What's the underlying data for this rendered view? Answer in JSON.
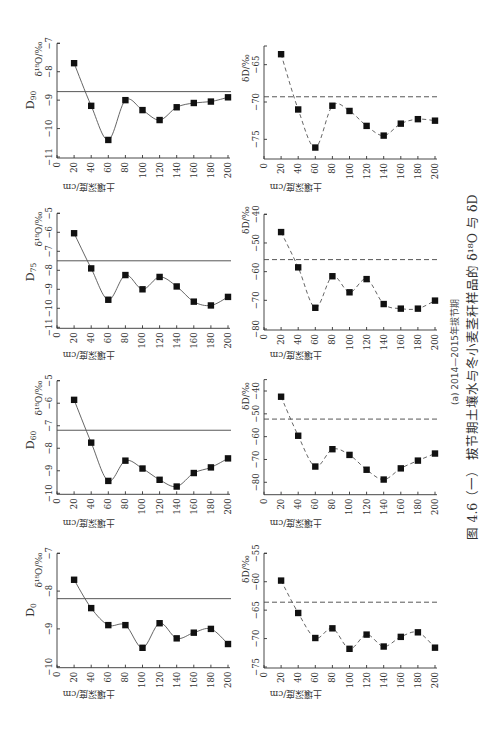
{
  "figure": {
    "caption": "图 4.6（一）  拔节期土壤水与冬小麦茎秆样品的 δ¹⁸O 与 δD",
    "subcaption": "(a) 2014—2015年拔节期",
    "layout_note": "page rotated 90° counter-clockwise; soil depth axis runs horizontally"
  },
  "chart_data": [
    {
      "type": "line",
      "panel": "D90",
      "label_main": "D",
      "label_sub": "90",
      "variable": "δ18O",
      "xlabel": "土壤深度/cm",
      "ylabel": "δ¹⁸O/‰",
      "x": [
        20,
        40,
        60,
        80,
        100,
        120,
        140,
        160,
        180,
        200
      ],
      "values": [
        -7.7,
        -9.2,
        -10.4,
        -9.0,
        -9.35,
        -9.7,
        -9.25,
        -9.1,
        -9.05,
        -8.9
      ],
      "xlim": [
        0,
        200
      ],
      "ylim": [
        -11,
        -7
      ],
      "xticks": [
        0,
        20,
        40,
        60,
        80,
        100,
        120,
        140,
        160,
        180,
        200
      ],
      "xticklabels": [
        "0",
        "20",
        "40",
        "60",
        "80",
        "100",
        "120",
        "140",
        "160",
        "180",
        "200"
      ],
      "yticks": [
        -11,
        -10,
        -9,
        -8,
        -7
      ],
      "yticklabels": [
        "−11",
        "−10",
        "−9",
        "−8",
        "−7"
      ],
      "reference_line": -8.7,
      "reference_style": "solid",
      "line_style": "solid",
      "marker": "square",
      "grid": false
    },
    {
      "type": "line",
      "panel": "D90",
      "label_main": "D",
      "label_sub": "90",
      "variable": "δD",
      "xlabel": "土壤深度/cm",
      "ylabel": "δD/‰",
      "x": [
        20,
        40,
        60,
        80,
        100,
        120,
        140,
        160,
        180,
        200
      ],
      "values": [
        -63.6,
        -71.0,
        -76.1,
        -70.5,
        -71.2,
        -73.2,
        -74.5,
        -72.9,
        -72.3,
        -72.5
      ],
      "xlim": [
        0,
        200
      ],
      "ylim": [
        -77.5,
        -62.5
      ],
      "xticks": [
        0,
        20,
        40,
        60,
        80,
        100,
        120,
        140,
        160,
        180,
        200
      ],
      "xticklabels": [
        "0",
        "20",
        "40",
        "60",
        "80",
        "100",
        "120",
        "140",
        "160",
        "180",
        "200"
      ],
      "yticks": [
        -75,
        -70,
        -65
      ],
      "yticklabels": [
        "−75",
        "−70",
        "−65"
      ],
      "reference_line": -69.3,
      "reference_style": "dashed",
      "line_style": "dashed",
      "marker": "square",
      "grid": false
    },
    {
      "type": "line",
      "panel": "D75",
      "label_main": "D",
      "label_sub": "75",
      "variable": "δ18O",
      "xlabel": "土壤深度/cm",
      "ylabel": "δ¹⁸O/‰",
      "x": [
        20,
        40,
        60,
        80,
        100,
        120,
        140,
        160,
        180,
        200
      ],
      "values": [
        -6.05,
        -7.9,
        -9.55,
        -8.25,
        -9.0,
        -8.35,
        -8.85,
        -9.65,
        -9.85,
        -9.4
      ],
      "xlim": [
        0,
        200
      ],
      "ylim": [
        -11,
        -5
      ],
      "xticks": [
        0,
        20,
        40,
        60,
        80,
        100,
        120,
        140,
        160,
        180,
        200
      ],
      "xticklabels": [
        "0",
        "20",
        "40",
        "60",
        "80",
        "100",
        "120",
        "140",
        "160",
        "180",
        "200"
      ],
      "yticks": [
        -11,
        -10,
        -9,
        -8,
        -7,
        -6,
        -5
      ],
      "yticklabels": [
        "−11",
        "−10",
        "−9",
        "−8",
        "−7",
        "−6",
        "−5"
      ],
      "reference_line": -7.5,
      "reference_style": "solid",
      "line_style": "solid",
      "marker": "square",
      "grid": false
    },
    {
      "type": "line",
      "panel": "D75",
      "label_main": "D",
      "label_sub": "75",
      "variable": "δD",
      "xlabel": "土壤深度/cm",
      "ylabel": "δD/‰",
      "x": [
        20,
        40,
        60,
        80,
        100,
        120,
        140,
        160,
        180,
        200
      ],
      "values": [
        -46.2,
        -58.5,
        -72.6,
        -61.6,
        -67.2,
        -62.6,
        -71.3,
        -72.9,
        -72.9,
        -70.1
      ],
      "xlim": [
        0,
        200
      ],
      "ylim": [
        -80,
        -40
      ],
      "xticks": [
        0,
        20,
        40,
        60,
        80,
        100,
        120,
        140,
        160,
        180,
        200
      ],
      "xticklabels": [
        "0",
        "20",
        "40",
        "60",
        "80",
        "100",
        "120",
        "140",
        "160",
        "180",
        "200"
      ],
      "yticks": [
        -80,
        -70,
        -60,
        -50,
        -40
      ],
      "yticklabels": [
        "−80",
        "−70",
        "−60",
        "−50",
        "−40"
      ],
      "reference_line": -55.8,
      "reference_style": "dashed",
      "line_style": "dashed",
      "marker": "square",
      "grid": false
    },
    {
      "type": "line",
      "panel": "D60",
      "label_main": "D",
      "label_sub": "60",
      "variable": "δ18O",
      "xlabel": "土壤深度/cm",
      "ylabel": "δ¹⁸O/‰",
      "x": [
        20,
        40,
        60,
        80,
        100,
        120,
        140,
        160,
        180,
        200
      ],
      "values": [
        -5.85,
        -7.75,
        -9.45,
        -8.55,
        -8.9,
        -9.4,
        -9.7,
        -9.1,
        -8.85,
        -8.45
      ],
      "xlim": [
        0,
        200
      ],
      "ylim": [
        -10,
        -5
      ],
      "xticks": [
        0,
        20,
        40,
        60,
        80,
        100,
        120,
        140,
        160,
        180,
        200
      ],
      "xticklabels": [
        "0",
        "20",
        "40",
        "60",
        "80",
        "100",
        "120",
        "140",
        "160",
        "180",
        "200"
      ],
      "yticks": [
        -10,
        -9,
        -8,
        -7,
        -6,
        -5
      ],
      "yticklabels": [
        "−10",
        "−9",
        "−8",
        "−7",
        "−6",
        "−5"
      ],
      "reference_line": -7.2,
      "reference_style": "solid",
      "line_style": "solid",
      "marker": "square",
      "grid": false
    },
    {
      "type": "line",
      "panel": "D60",
      "label_main": "D",
      "label_sub": "60",
      "variable": "δD",
      "xlabel": "土壤深度/cm",
      "ylabel": "δD/‰",
      "x": [
        20,
        40,
        60,
        80,
        100,
        120,
        140,
        160,
        180,
        200
      ],
      "values": [
        -42.5,
        -59.6,
        -73.1,
        -65.5,
        -68.0,
        -74.5,
        -78.8,
        -73.9,
        -70.5,
        -67.4
      ],
      "xlim": [
        0,
        200
      ],
      "ylim": [
        -85,
        -35
      ],
      "xticks": [
        0,
        20,
        40,
        60,
        80,
        100,
        120,
        140,
        160,
        180,
        200
      ],
      "xticklabels": [
        "0",
        "20",
        "40",
        "60",
        "80",
        "100",
        "120",
        "140",
        "160",
        "180",
        "200"
      ],
      "yticks": [
        -80,
        -70,
        -60,
        -50,
        -40
      ],
      "yticklabels": [
        "−80",
        "−70",
        "−60",
        "−50",
        "−40"
      ],
      "reference_line": -52.3,
      "reference_style": "dashed",
      "line_style": "dashed",
      "marker": "square",
      "grid": false
    },
    {
      "type": "line",
      "panel": "D0",
      "label_main": "D",
      "label_sub": "0",
      "variable": "δ18O",
      "xlabel": "土壤深度/cm",
      "ylabel": "δ¹⁸O/‰",
      "x": [
        20,
        40,
        60,
        80,
        100,
        120,
        140,
        160,
        180,
        200
      ],
      "values": [
        -7.7,
        -8.45,
        -8.9,
        -8.9,
        -9.5,
        -8.85,
        -9.25,
        -9.1,
        -9.0,
        -9.4
      ],
      "xlim": [
        0,
        200
      ],
      "ylim": [
        -10,
        -7
      ],
      "xticks": [
        0,
        20,
        40,
        60,
        80,
        100,
        120,
        140,
        160,
        180,
        200
      ],
      "xticklabels": [
        "0",
        "20",
        "40",
        "60",
        "80",
        "100",
        "120",
        "140",
        "160",
        "180",
        "200"
      ],
      "yticks": [
        -10,
        -9,
        -8,
        -7
      ],
      "yticklabels": [
        "−10",
        "−9",
        "−8",
        "−7"
      ],
      "reference_line": -8.2,
      "reference_style": "solid",
      "line_style": "solid",
      "marker": "square",
      "grid": false
    },
    {
      "type": "line",
      "panel": "D0",
      "label_main": "D",
      "label_sub": "0",
      "variable": "δD",
      "xlabel": "土壤深度/cm",
      "ylabel": "δD/‰",
      "x": [
        20,
        40,
        60,
        80,
        100,
        120,
        140,
        160,
        180,
        200
      ],
      "values": [
        -59.8,
        -65.5,
        -69.9,
        -68.2,
        -71.8,
        -69.3,
        -71.4,
        -69.7,
        -68.9,
        -71.6
      ],
      "xlim": [
        0,
        200
      ],
      "ylim": [
        -75,
        -55
      ],
      "xticks": [
        0,
        20,
        40,
        60,
        80,
        100,
        120,
        140,
        160,
        180,
        200
      ],
      "xticklabels": [
        "0",
        "20",
        "40",
        "60",
        "80",
        "100",
        "120",
        "140",
        "160",
        "180",
        "200"
      ],
      "yticks": [
        -75,
        -70,
        -65,
        -60,
        -55
      ],
      "yticklabels": [
        "−75",
        "−70",
        "−65",
        "−60",
        "−55"
      ],
      "reference_line": -63.6,
      "reference_style": "dashed",
      "line_style": "dashed",
      "marker": "square",
      "grid": false
    }
  ]
}
